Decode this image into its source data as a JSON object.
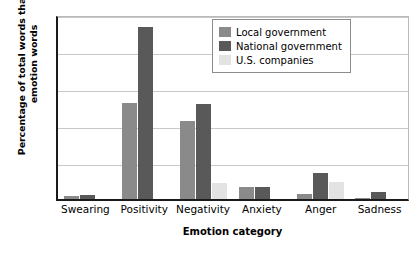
{
  "chart_data": {
    "type": "bar",
    "title": "",
    "xlabel": "Emotion category",
    "ylabel": "Percentage of total words that are emotion words",
    "categories": [
      "Swearing",
      "Positivity",
      "Negativity",
      "Anxiety",
      "Anger",
      "Sadness"
    ],
    "series": [
      {
        "name": "Local government",
        "color": "#8a8a8a",
        "values": [
          0.04,
          1.3,
          1.06,
          0.16,
          0.07,
          0.02
        ]
      },
      {
        "name": "National government",
        "color": "#595959",
        "values": [
          0.05,
          2.33,
          1.29,
          0.16,
          0.35,
          0.09
        ]
      },
      {
        "name": "U.S. companies",
        "color": "#e3e3e3",
        "values": [
          0.0,
          0.0,
          0.22,
          0.0,
          0.23,
          0.0
        ]
      }
    ],
    "ylim": [
      0,
      2.5
    ],
    "yticks": [
      "0",
      "0.5",
      "1.0",
      "1.5",
      "2.0",
      "2.5"
    ],
    "ytick_values": [
      0,
      0.5,
      1.0,
      1.5,
      2.0,
      2.5
    ],
    "grid": true,
    "legend_position": "top-right"
  }
}
